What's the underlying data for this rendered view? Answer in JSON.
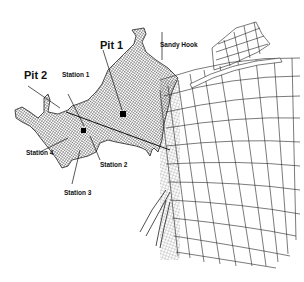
{
  "diagram": {
    "type": "finite-element-mesh-map",
    "colors": {
      "mesh": "#222222",
      "background": "#ffffff",
      "marker": "#000000"
    },
    "labels": {
      "pit1": "Pit 1",
      "pit2": "Pit 2",
      "sandy_hook": "Sandy Hook",
      "station1": "Station 1",
      "station2": "Station 2",
      "station3": "Station 3",
      "station4": "Station 4"
    },
    "markers": [
      {
        "name": "pit1",
        "x": 124,
        "y": 114
      },
      {
        "name": "pit2-station",
        "x": 84,
        "y": 131
      }
    ]
  }
}
